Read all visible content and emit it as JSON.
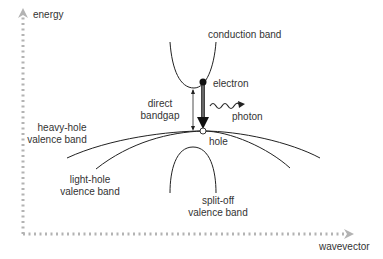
{
  "axes": {
    "y_label": "energy",
    "x_label": "wavevector",
    "axis_color": "#b3b3b3"
  },
  "labels": {
    "conduction_band": "conduction band",
    "electron": "electron",
    "photon": "photon",
    "direct_bandgap_line1": "direct",
    "direct_bandgap_line2": "bandgap",
    "heavy_hole_line1": "heavy-hole",
    "heavy_hole_line2": "valence band",
    "hole": "hole",
    "light_hole_line1": "light-hole",
    "light_hole_line2": "valence band",
    "split_off_line1": "split-off",
    "split_off_line2": "valence band"
  },
  "colors": {
    "curve": "#222222",
    "text": "#333333",
    "axis": "#b3b3b3"
  }
}
